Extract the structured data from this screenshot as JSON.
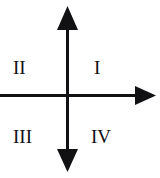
{
  "figure": {
    "kind": "cartesian-quadrant-diagram",
    "background_color": "#ffffff",
    "stroke_color": "#111114",
    "label_color": "#111114"
  },
  "axes": {
    "origin": {
      "x": 67,
      "y": 95
    },
    "vertical": {
      "name": "y-axis",
      "arrow_up": true,
      "arrow_down": true,
      "top_y": 6,
      "bottom_y": 172,
      "stroke_width": 3
    },
    "horizontal": {
      "name": "x-axis",
      "arrow_right": true,
      "arrow_left": false,
      "left_x": 0,
      "right_x": 156,
      "stroke_width": 3
    }
  },
  "quadrants": [
    {
      "id": "I",
      "label": "I",
      "position": "upper-right"
    },
    {
      "id": "II",
      "label": "II",
      "position": "upper-left"
    },
    {
      "id": "III",
      "label": "III",
      "position": "lower-left"
    },
    {
      "id": "IV",
      "label": "IV",
      "position": "lower-right"
    }
  ],
  "labels": {
    "quadrant_1": "I",
    "quadrant_2": "II",
    "quadrant_3": "III",
    "quadrant_4": "IV"
  }
}
